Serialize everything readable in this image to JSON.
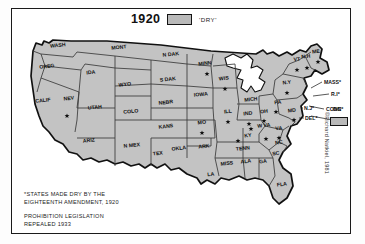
{
  "title": "1920",
  "legend": {
    "swatch_label": "'DRY'",
    "swatch_color": "#b9b9b9"
  },
  "notes": {
    "line1": "*STATES MADE DRY BY THE\nEIGHTEENTH AMENDMENT, 1920",
    "line2": "PROHIBITION LEGISLATION\nREPEALED 1933"
  },
  "credit": "©Richard Natkiel, 1981",
  "dc": {
    "label": "DC"
  },
  "map": {
    "fill_color": "#c3c3c3",
    "border_color": "#3a3a3a",
    "coast_color": "#111111",
    "states": [
      {
        "name": "WASH",
        "x": 47,
        "y": 39
      },
      {
        "name": "OREG",
        "x": 36,
        "y": 60
      },
      {
        "name": "CALIF",
        "x": 32,
        "y": 94
      },
      {
        "name": "NEV",
        "x": 58,
        "y": 92
      },
      {
        "name": "IDA",
        "x": 80,
        "y": 66
      },
      {
        "name": "MONT",
        "x": 108,
        "y": 41
      },
      {
        "name": "WYO",
        "x": 114,
        "y": 78
      },
      {
        "name": "UTAH",
        "x": 84,
        "y": 101
      },
      {
        "name": "COLO",
        "x": 120,
        "y": 105
      },
      {
        "name": "ARIZ",
        "x": 78,
        "y": 134
      },
      {
        "name": "N MEX",
        "x": 121,
        "y": 139
      },
      {
        "name": "N DAK",
        "x": 160,
        "y": 48
      },
      {
        "name": "S DAK",
        "x": 157,
        "y": 73
      },
      {
        "name": "NEBR",
        "x": 155,
        "y": 96
      },
      {
        "name": "KANS",
        "x": 155,
        "y": 120
      },
      {
        "name": "OKLA",
        "x": 168,
        "y": 142
      },
      {
        "name": "TEX",
        "x": 147,
        "y": 147
      },
      {
        "name": "MINN",
        "x": 194,
        "y": 57
      },
      {
        "name": "IOWA",
        "x": 190,
        "y": 88
      },
      {
        "name": "MO",
        "x": 191,
        "y": 116
      },
      {
        "name": "ARK",
        "x": 193,
        "y": 140
      },
      {
        "name": "LA",
        "x": 200,
        "y": 168
      },
      {
        "name": "WIS",
        "x": 213,
        "y": 72
      },
      {
        "name": "ILL",
        "x": 217,
        "y": 105
      },
      {
        "name": "MICH",
        "x": 240,
        "y": 93
      },
      {
        "name": "IND",
        "x": 237,
        "y": 107
      },
      {
        "name": "OH",
        "x": 253,
        "y": 105
      },
      {
        "name": "KY",
        "x": 237,
        "y": 129
      },
      {
        "name": "TENN",
        "x": 232,
        "y": 142
      },
      {
        "name": "MISS",
        "x": 216,
        "y": 157
      },
      {
        "name": "ALA",
        "x": 235,
        "y": 155
      },
      {
        "name": "GA",
        "x": 252,
        "y": 155
      },
      {
        "name": "FLA",
        "x": 271,
        "y": 178
      },
      {
        "name": "SC",
        "x": 265,
        "y": 147
      },
      {
        "name": "NC",
        "x": 268,
        "y": 136
      },
      {
        "name": "VA",
        "x": 268,
        "y": 122
      },
      {
        "name": "W VA",
        "x": 253,
        "y": 119
      },
      {
        "name": "PA",
        "x": 267,
        "y": 96
      },
      {
        "name": "MD",
        "x": 281,
        "y": 104
      },
      {
        "name": "N.Y",
        "x": 276,
        "y": 76
      },
      {
        "name": "VT",
        "x": 286,
        "y": 53
      },
      {
        "name": "N.H",
        "x": 295,
        "y": 50
      },
      {
        "name": "ME",
        "x": 305,
        "y": 45
      }
    ],
    "callouts": [
      {
        "name": "MASS*",
        "x": 313,
        "y": 76
      },
      {
        "name": "R.I*",
        "x": 320,
        "y": 88
      },
      {
        "name": "CONN*",
        "x": 315,
        "y": 103
      },
      {
        "name": "N.J*",
        "x": 293,
        "y": 102
      },
      {
        "name": "DEL*",
        "x": 294,
        "y": 112
      }
    ],
    "dry_star_states": [
      "MINN",
      "WIS",
      "IOWA",
      "MO",
      "ILL",
      "IND",
      "OH",
      "N.Y",
      "VA",
      "NC",
      "SC",
      "GA",
      "PA",
      "MD",
      "ME",
      "N.H",
      "VT",
      "W VA",
      "NEBR"
    ],
    "star_markers": [
      {
        "x": 196,
        "y": 66
      },
      {
        "x": 214,
        "y": 81
      },
      {
        "x": 217,
        "y": 114
      },
      {
        "x": 191,
        "y": 125
      },
      {
        "x": 238,
        "y": 116
      },
      {
        "x": 253,
        "y": 113
      },
      {
        "x": 276,
        "y": 85
      },
      {
        "x": 265,
        "y": 104
      },
      {
        "x": 283,
        "y": 112
      },
      {
        "x": 296,
        "y": 60
      },
      {
        "x": 286,
        "y": 62
      },
      {
        "x": 307,
        "y": 54
      },
      {
        "x": 268,
        "y": 130
      },
      {
        "x": 255,
        "y": 131
      },
      {
        "x": 240,
        "y": 121
      },
      {
        "x": 227,
        "y": 133
      },
      {
        "x": 56,
        "y": 108
      }
    ]
  }
}
